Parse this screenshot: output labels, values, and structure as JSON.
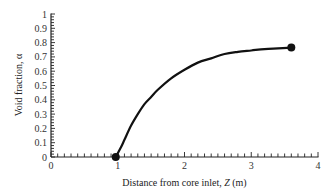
{
  "chart_data": {
    "type": "line",
    "title": "",
    "xlabel": "Distance from core inlet, Z (m)",
    "xlabel_parts": {
      "prefix": "Distance from core inlet, ",
      "var": "Z",
      "suffix": " (m)"
    },
    "ylabel": "Void fraction, α",
    "xlim": [
      0,
      4
    ],
    "ylim": [
      0,
      1
    ],
    "x_ticks": [
      0,
      1,
      2,
      3,
      4
    ],
    "x_tick_labels": [
      "0",
      "1",
      "2",
      "3",
      "4"
    ],
    "x_minor_step": 0.1,
    "y_ticks": [
      0,
      0.1,
      0.2,
      0.3,
      0.4,
      0.5,
      0.6,
      0.7,
      0.8,
      0.9,
      1
    ],
    "y_tick_labels": [
      "0",
      "0.1",
      "0.2",
      "0.3",
      "0.4",
      "0.5",
      "0.6",
      "0.7",
      "0.8",
      "0.9",
      "1"
    ],
    "y_minor_step": 0.02,
    "grid": false,
    "legend": null,
    "series": [
      {
        "name": "Void fraction",
        "color": "#111111",
        "x": [
          0.97,
          1.05,
          1.1,
          1.2,
          1.3,
          1.4,
          1.5,
          1.6,
          1.8,
          2.0,
          2.2,
          2.4,
          2.6,
          2.8,
          3.0,
          3.2,
          3.4,
          3.6
        ],
        "y": [
          0.0,
          0.07,
          0.12,
          0.22,
          0.3,
          0.37,
          0.42,
          0.47,
          0.55,
          0.61,
          0.66,
          0.69,
          0.72,
          0.735,
          0.745,
          0.755,
          0.76,
          0.765
        ]
      }
    ],
    "markers": [
      {
        "x": 0.97,
        "y": 0.0,
        "label": "onset"
      },
      {
        "x": 3.6,
        "y": 0.765,
        "label": "exit"
      }
    ]
  }
}
